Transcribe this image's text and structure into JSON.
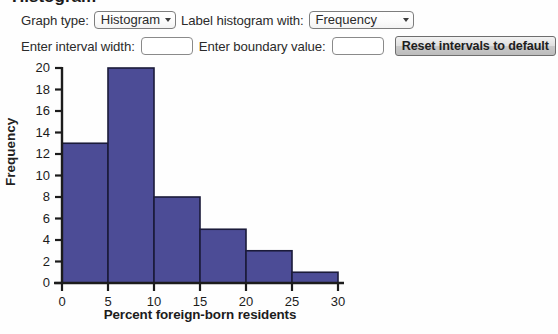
{
  "page": {
    "clipped_title_fragment": "Histogram"
  },
  "controls": {
    "graph_type_label": "Graph type:",
    "graph_type_value": "Histogram",
    "graph_type_options": [
      "Histogram"
    ],
    "label_with_label": "Label histogram with:",
    "label_with_value": "Frequency",
    "label_with_options": [
      "Frequency"
    ],
    "interval_width_label": "Enter interval width:",
    "interval_width_value": "",
    "interval_width_placeholder": "",
    "boundary_value_label": "Enter boundary value:",
    "boundary_value_value": "",
    "boundary_value_placeholder": "",
    "reset_button_label": "Reset intervals to default"
  },
  "colors": {
    "bar_fill": "#4c4c96",
    "bar_stroke": "#1b1b3a",
    "axis": "#1c1c1c",
    "button_text": "#1e1e1e"
  },
  "chart_data": {
    "type": "bar",
    "title": "",
    "subtitle": "",
    "xlabel": "Percent foreign-born residents",
    "ylabel": "Frequency",
    "xlim": [
      0,
      30
    ],
    "ylim": [
      0,
      20
    ],
    "xticks": [
      0,
      5,
      10,
      15,
      20,
      25,
      30
    ],
    "xtick_labels": [
      "0",
      "5",
      "10",
      "15",
      "20",
      "25",
      "30"
    ],
    "yticks": [
      0,
      2,
      4,
      6,
      8,
      10,
      12,
      14,
      16,
      18,
      20
    ],
    "ytick_labels": [
      "0",
      "2",
      "4",
      "6",
      "8",
      "10",
      "12",
      "14",
      "16",
      "18",
      "20"
    ],
    "grid": false,
    "legend": false,
    "bin_width": 5,
    "bin_edges": [
      0,
      5,
      10,
      15,
      20,
      25,
      30
    ],
    "categories": [
      "0-5",
      "5-10",
      "10-15",
      "15-20",
      "20-25",
      "25-30"
    ],
    "values": [
      13,
      20,
      8,
      5,
      3,
      1
    ],
    "data_labels": []
  }
}
